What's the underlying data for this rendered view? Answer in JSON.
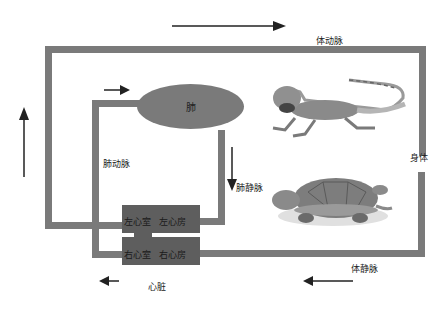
{
  "diagram": {
    "type": "double-circulation",
    "labels": {
      "systemic_artery": "体动脉",
      "systemic_vein": "体静脉",
      "pulmonary_artery": "肺动脉",
      "pulmonary_vein": "肺静脉",
      "lung": "肺",
      "body": "身体",
      "heart": "心脏"
    },
    "heart_chambers": {
      "upper_left": "左心室",
      "upper_right": "左心房",
      "lower_left": "右心室",
      "lower_right": "右心房"
    },
    "images": [
      {
        "name": "lizard",
        "description": "bearded dragon lizard photo"
      },
      {
        "name": "turtle",
        "description": "red-eared slider turtle photo"
      }
    ],
    "arrows": [
      {
        "position": "top",
        "direction": "right"
      },
      {
        "position": "left",
        "direction": "up"
      },
      {
        "position": "lung-inlet",
        "direction": "right"
      },
      {
        "position": "pulmonary-vein",
        "direction": "down"
      },
      {
        "position": "bottom-right",
        "direction": "left"
      },
      {
        "position": "bottom-left",
        "direction": "left"
      }
    ],
    "colors": {
      "vessel": "#7a7a7a",
      "heart": "#5e5e5e",
      "arrow": "#222222"
    }
  }
}
